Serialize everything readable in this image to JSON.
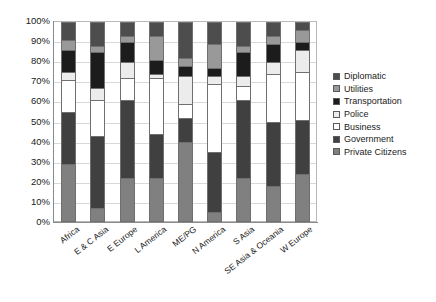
{
  "chart_data": {
    "type": "bar",
    "subtype": "stacked-100-percent",
    "title": "",
    "xlabel": "",
    "ylabel": "",
    "ylim": [
      0,
      100
    ],
    "ytick_labels": [
      "100%",
      "90%",
      "80%",
      "70%",
      "60%",
      "50%",
      "40%",
      "30%",
      "20%",
      "10%",
      "0%"
    ],
    "ytick_values": [
      100,
      90,
      80,
      70,
      60,
      50,
      40,
      30,
      20,
      10,
      0
    ],
    "grid": true,
    "legend_position": "right",
    "categories": [
      "Africa",
      "E & C Asia",
      "E Europe",
      "L America",
      "ME/PG",
      "N America",
      "S Asia",
      "SE Asia & Oceania",
      "W Europe"
    ],
    "series": [
      {
        "name": "Private Citizens",
        "color": "#808080",
        "values": [
          29,
          7,
          22,
          22,
          40,
          5,
          22,
          18,
          24
        ]
      },
      {
        "name": "Government",
        "color": "#404040",
        "values": [
          26,
          36,
          39,
          22,
          12,
          30,
          39,
          32,
          27
        ]
      },
      {
        "name": "Business",
        "color": "#ffffff",
        "values": [
          16,
          18,
          11,
          28,
          7,
          34,
          7,
          24,
          24
        ]
      },
      {
        "name": "Police",
        "color": "#ececec",
        "values": [
          4,
          6,
          8,
          2,
          14,
          4,
          5,
          6,
          11
        ]
      },
      {
        "name": "Transportation",
        "color": "#1c1c1c",
        "values": [
          11,
          18,
          10,
          7,
          5,
          4,
          12,
          9,
          4
        ]
      },
      {
        "name": "Utilities",
        "color": "#999999",
        "values": [
          5,
          3,
          3,
          12,
          4,
          12,
          3,
          4,
          6
        ]
      },
      {
        "name": "Diplomatic",
        "color": "#4d4d4d",
        "values": [
          9,
          12,
          7,
          7,
          18,
          11,
          12,
          7,
          4
        ]
      }
    ],
    "legend_order": [
      "Diplomatic",
      "Utilities",
      "Transportation",
      "Police",
      "Business",
      "Government",
      "Private Citizens"
    ]
  },
  "legend": {
    "items": [
      {
        "label": "Diplomatic",
        "color": "#4d4d4d"
      },
      {
        "label": "Utilities",
        "color": "#999999"
      },
      {
        "label": "Transportation",
        "color": "#1c1c1c"
      },
      {
        "label": "Police",
        "color": "#ececec"
      },
      {
        "label": "Business",
        "color": "#ffffff"
      },
      {
        "label": "Government",
        "color": "#404040"
      },
      {
        "label": "Private Citizens",
        "color": "#808080"
      }
    ]
  }
}
